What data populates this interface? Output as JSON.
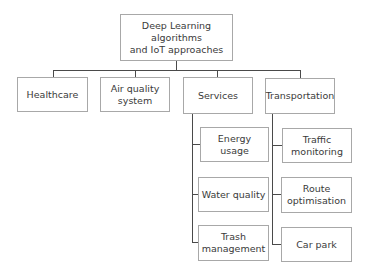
{
  "diagram": {
    "root": {
      "label_line1": "Deep Learning algorithms",
      "label_line2": "and IoT approaches"
    },
    "categories": [
      {
        "label_line1": "Healthcare",
        "label_line2": ""
      },
      {
        "label_line1": "Air quality",
        "label_line2": "system"
      },
      {
        "label_line1": "Services",
        "label_line2": ""
      },
      {
        "label_line1": "Transportation",
        "label_line2": ""
      }
    ],
    "services_children": [
      {
        "label_line1": "Energy usage",
        "label_line2": ""
      },
      {
        "label_line1": "Water quality",
        "label_line2": ""
      },
      {
        "label_line1": "Trash",
        "label_line2": "management"
      }
    ],
    "transportation_children": [
      {
        "label_line1": "Traffic",
        "label_line2": "monitoring"
      },
      {
        "label_line1": "Route",
        "label_line2": "optimisation"
      },
      {
        "label_line1": "Car park",
        "label_line2": ""
      }
    ],
    "colors": {
      "box_border": "#a8a8a8",
      "connector": "#4a4a4a",
      "text": "#3a3a3a"
    }
  }
}
